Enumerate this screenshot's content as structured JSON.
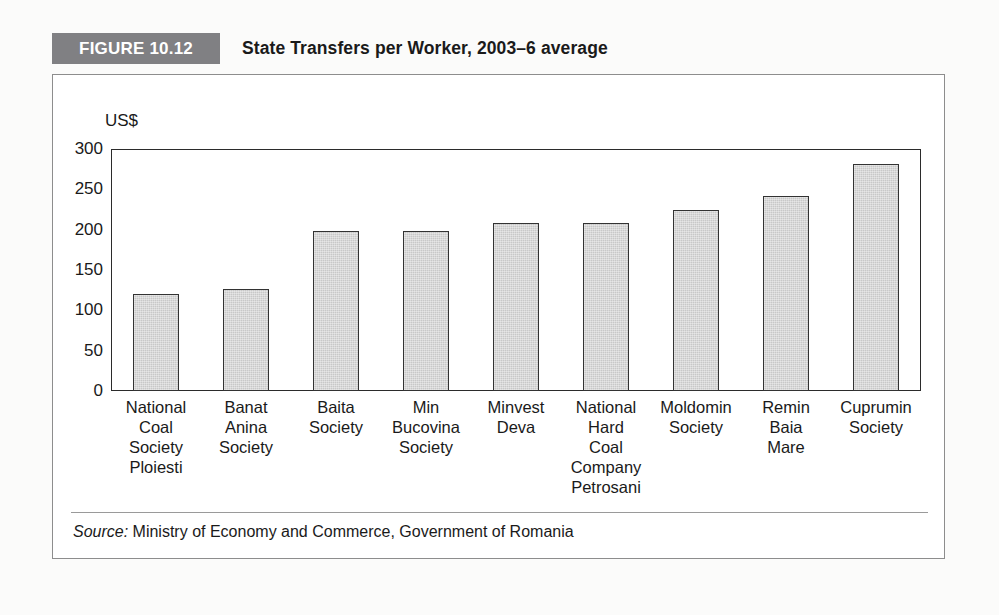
{
  "figure": {
    "badge_label": "FIGURE 10.12",
    "title": "State Transfers per Worker, 2003–6 average",
    "badge_color": "#808083",
    "frame_color": "#8d8d8d",
    "source_prefix": "Source:",
    "source_text": " Ministry of Economy and Commerce, Government of Romania"
  },
  "chart_data": {
    "type": "bar",
    "title": "State Transfers per Worker, 2003–6 average",
    "xlabel": "",
    "ylabel": "US$",
    "ylim": [
      0,
      300
    ],
    "yticks": [
      300,
      250,
      200,
      150,
      100,
      50,
      0
    ],
    "grid": false,
    "legend": "none",
    "bar_color": "#c8c8c8",
    "bar_border_color": "#333333",
    "categories": [
      "National Coal Society Ploiesti",
      "Banat Anina Society",
      "Baita Society",
      "Min Bucovina Society",
      "Minvest Deva",
      "National Hard Coal Company Petrosani",
      "Moldomin Society",
      "Remin Baia Mare",
      "Cuprumin Society"
    ],
    "category_lines": [
      [
        "National",
        "Coal",
        "Society",
        "Ploiesti"
      ],
      [
        "Banat",
        "Anina",
        "Society"
      ],
      [
        "Baita",
        "Society"
      ],
      [
        "Min",
        "Bucovina",
        "Society"
      ],
      [
        "Minvest",
        "Deva"
      ],
      [
        "National",
        "Hard",
        "Coal",
        "Company",
        "Petrosani"
      ],
      [
        "Moldomin",
        "Society"
      ],
      [
        "Remin",
        "Baia",
        "Mare"
      ],
      [
        "Cuprumin",
        "Society"
      ]
    ],
    "values": [
      120,
      126,
      198,
      198,
      208,
      208,
      224,
      242,
      282
    ]
  }
}
